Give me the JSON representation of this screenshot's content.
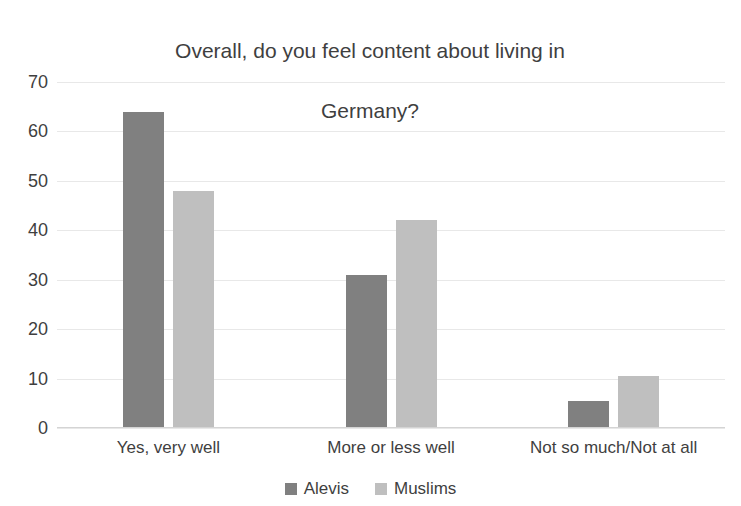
{
  "chart_data": {
    "type": "bar",
    "title": "Overall, do you feel content about living in Germany?",
    "title_line1": "Overall, do you feel content about living in",
    "title_line2": "Germany?",
    "xlabel": "",
    "ylabel": "",
    "categories": [
      "Yes, very well",
      "More or less well",
      "Not so much/Not at all"
    ],
    "series": [
      {
        "name": "Alevis",
        "color": "#808080",
        "values": [
          64,
          31,
          5.5
        ]
      },
      {
        "name": "Muslims",
        "color": "#bfbfbf",
        "values": [
          48,
          42,
          10.5
        ]
      }
    ],
    "ylim": [
      0,
      70
    ],
    "yticks": [
      70,
      60,
      50,
      40,
      30,
      20,
      10,
      0
    ],
    "ytick_labels": [
      "70",
      "60",
      "50",
      "40",
      "30",
      "20",
      "10",
      "0"
    ],
    "grid": true,
    "legend_position": "bottom"
  }
}
